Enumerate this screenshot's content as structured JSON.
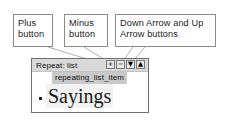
{
  "diagram": {
    "line_color": "#9a9a9a",
    "box_border_color": "#8a8a8a",
    "panel_border_color": "#6f6f6f",
    "toolbar_bg": "#d9d9d9",
    "token_bg": "#c9c9c9",
    "text_color": "#1a1a1a"
  },
  "callouts": [
    {
      "id": "plus",
      "line1": "Plus",
      "line2": "button"
    },
    {
      "id": "minus",
      "line1": "Minus",
      "line2": "button"
    },
    {
      "id": "arrows",
      "line1": "Down Arrow and Up",
      "line2": "Arrow buttons"
    }
  ],
  "panel": {
    "toolbar": {
      "repeat_label": "Repeat: list",
      "buttons": [
        {
          "name": "plus-button",
          "glyph": "+"
        },
        {
          "name": "minus-button",
          "glyph": "−"
        },
        {
          "name": "down-arrow-button",
          "glyph": "▼"
        },
        {
          "name": "up-arrow-button",
          "glyph": "▲"
        }
      ]
    },
    "token_label": "repeating_list_item",
    "bullet_glyph": "▪",
    "list_text": "Sayings"
  }
}
